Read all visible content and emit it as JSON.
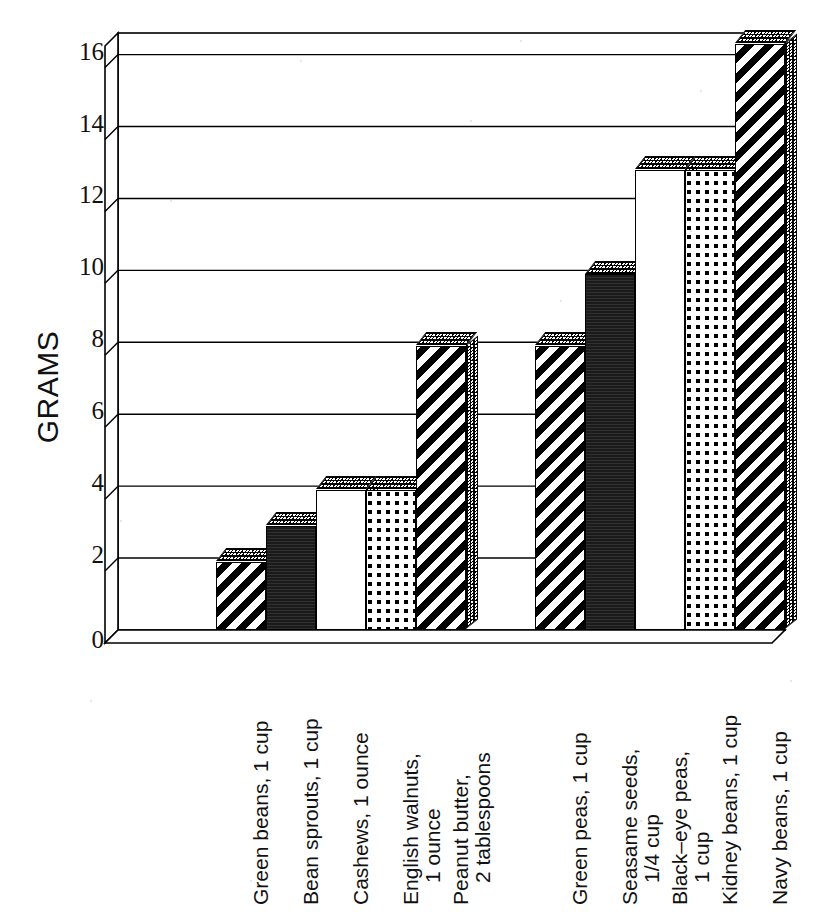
{
  "chart_data": {
    "type": "bar",
    "title": "",
    "xlabel": "",
    "ylabel": "GRAMS",
    "ylim": [
      0,
      16.6
    ],
    "yticks": [
      0,
      2,
      4,
      6,
      8,
      10,
      12,
      14,
      16
    ],
    "ytick_labels": [
      "0",
      "2",
      "4",
      "6",
      "8",
      "10",
      "12",
      "14",
      "16"
    ],
    "grid": true,
    "legend": "none",
    "style": "3d-bar",
    "groups": [
      {
        "name": "group-1",
        "items": [
          {
            "label_line1": "Green beans, 1 cup",
            "label_line2": "",
            "value": 1.9,
            "pattern": "diagonal-stripes"
          },
          {
            "label_line1": "Bean sprouts, 1 cup",
            "label_line2": "",
            "value": 2.9,
            "pattern": "solid-black"
          },
          {
            "label_line1": "Cashews, 1 ounce",
            "label_line2": "",
            "value": 3.9,
            "pattern": "checkerboard"
          },
          {
            "label_line1": "English walnuts,",
            "label_line2": "1 ounce",
            "value": 3.9,
            "pattern": "fine-dots"
          },
          {
            "label_line1": "Peanut butter,",
            "label_line2": "2 tablespoons",
            "value": 7.9,
            "pattern": "diagonal-stripes"
          }
        ]
      },
      {
        "name": "group-2",
        "items": [
          {
            "label_line1": "Green peas, 1 cup",
            "label_line2": "",
            "value": 7.9,
            "pattern": "diagonal-stripes"
          },
          {
            "label_line1": "Seasame seeds,",
            "label_line2": "1/4 cup",
            "value": 9.9,
            "pattern": "solid-black"
          },
          {
            "label_line1": "Black–eye peas,",
            "label_line2": "1 cup",
            "value": 12.8,
            "pattern": "checkerboard"
          },
          {
            "label_line1": "Kidney beans, 1 cup",
            "label_line2": "",
            "value": 12.8,
            "pattern": "fine-dots"
          },
          {
            "label_line1": "Navy beans, 1 cup",
            "label_line2": "",
            "value": 16.3,
            "pattern": "diagonal-stripes"
          }
        ]
      }
    ],
    "categories": [
      "Green beans, 1 cup",
      "Bean sprouts, 1 cup",
      "Cashews, 1 ounce",
      "English walnuts, 1 ounce",
      "Peanut butter, 2 tablespoons",
      "Green peas, 1 cup",
      "Seasame seeds, 1/4 cup",
      "Black–eye peas, 1 cup",
      "Kidney beans, 1 cup",
      "Navy beans, 1 cup"
    ],
    "values": [
      1.9,
      2.9,
      3.9,
      3.9,
      7.9,
      7.9,
      9.9,
      12.8,
      12.8,
      16.3
    ],
    "colors": {
      "axis": "#000000",
      "grid": "#000000",
      "background": "#ffffff",
      "bar_outline": "#000000",
      "bar_fill_solid": "#1a1a1a"
    }
  }
}
